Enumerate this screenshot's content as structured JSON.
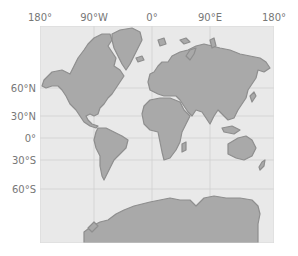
{
  "map": {
    "projection": "Mercator",
    "colors": {
      "ocean": "#e9e9e9",
      "land": "#a9a9a9",
      "coast": "#8e8e8e",
      "grid": "#cfcfcf",
      "label": "#777777"
    },
    "longitude_labels": [
      {
        "text": "180°",
        "x": 40
      },
      {
        "text": "90°W",
        "x": 94
      },
      {
        "text": "0°",
        "x": 152
      },
      {
        "text": "90°E",
        "x": 210
      },
      {
        "text": "180°",
        "x": 274
      }
    ],
    "latitude_labels": [
      {
        "text": "60°N",
        "y": 88
      },
      {
        "text": "30°N",
        "y": 116
      },
      {
        "text": "0°",
        "y": 138
      },
      {
        "text": "30°S",
        "y": 160
      },
      {
        "text": "60°S",
        "y": 189
      }
    ]
  }
}
